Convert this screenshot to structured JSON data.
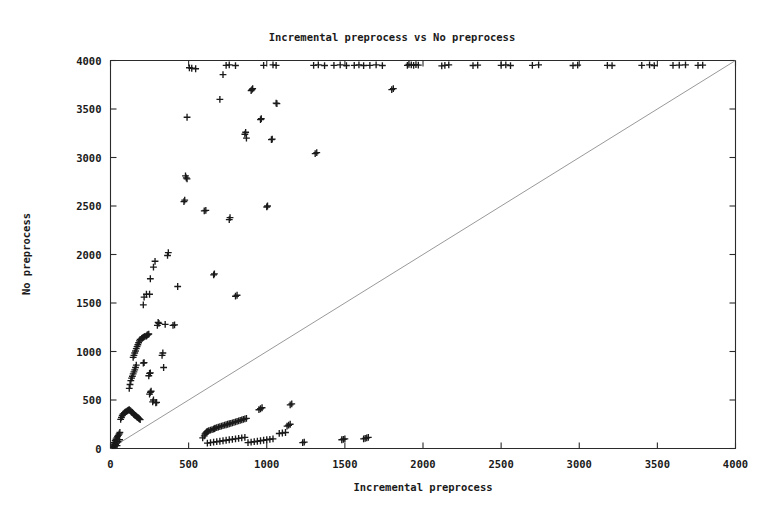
{
  "chart_data": {
    "type": "scatter",
    "title": "Incremental preprocess vs No preprocess",
    "xlabel": "Incremental preprocess",
    "ylabel": "No preprocess",
    "xlim": [
      0,
      4000
    ],
    "ylim": [
      0,
      4000
    ],
    "xticks": [
      0,
      500,
      1000,
      1500,
      2000,
      2500,
      3000,
      3500,
      4000
    ],
    "yticks": [
      0,
      500,
      1000,
      1500,
      2000,
      2500,
      3000,
      3500,
      4000
    ],
    "xtick_labels": [
      "0",
      "500",
      "1000",
      "1500",
      "2000",
      "2500",
      "3000",
      "3500",
      "4000"
    ],
    "ytick_labels": [
      "0",
      "500",
      "1000",
      "1500",
      "2000",
      "2500",
      "3000",
      "3500",
      "4000"
    ],
    "grid": false,
    "legend": "none",
    "marker": "plus",
    "marker_color": "#1a1a1a",
    "reference_line": {
      "label": "y = x diagonal",
      "from": [
        0,
        0
      ],
      "to": [
        4000,
        4000
      ],
      "color": "#8d8d8d"
    },
    "series": [
      {
        "name": "runs",
        "points": [
          [
            10,
            10
          ],
          [
            15,
            20
          ],
          [
            18,
            35
          ],
          [
            20,
            15
          ],
          [
            22,
            45
          ],
          [
            25,
            60
          ],
          [
            28,
            25
          ],
          [
            30,
            80
          ],
          [
            32,
            40
          ],
          [
            35,
            95
          ],
          [
            38,
            55
          ],
          [
            40,
            110
          ],
          [
            42,
            30
          ],
          [
            45,
            125
          ],
          [
            48,
            70
          ],
          [
            50,
            135
          ],
          [
            55,
            150
          ],
          [
            58,
            90
          ],
          [
            60,
            165
          ],
          [
            65,
            300
          ],
          [
            70,
            320
          ],
          [
            75,
            340
          ],
          [
            80,
            355
          ],
          [
            85,
            360
          ],
          [
            90,
            370
          ],
          [
            95,
            375
          ],
          [
            100,
            380
          ],
          [
            105,
            385
          ],
          [
            110,
            390
          ],
          [
            115,
            395
          ],
          [
            120,
            400
          ],
          [
            125,
            392
          ],
          [
            130,
            385
          ],
          [
            135,
            378
          ],
          [
            140,
            370
          ],
          [
            145,
            362
          ],
          [
            150,
            350
          ],
          [
            155,
            345
          ],
          [
            160,
            340
          ],
          [
            165,
            332
          ],
          [
            170,
            325
          ],
          [
            175,
            318
          ],
          [
            180,
            312
          ],
          [
            185,
            305
          ],
          [
            190,
            298
          ],
          [
            120,
            620
          ],
          [
            125,
            660
          ],
          [
            130,
            700
          ],
          [
            135,
            725
          ],
          [
            140,
            745
          ],
          [
            145,
            770
          ],
          [
            150,
            790
          ],
          [
            155,
            810
          ],
          [
            160,
            835
          ],
          [
            165,
            860
          ],
          [
            145,
            940
          ],
          [
            150,
            960
          ],
          [
            155,
            985
          ],
          [
            160,
            1005
          ],
          [
            165,
            1030
          ],
          [
            170,
            1050
          ],
          [
            175,
            1070
          ],
          [
            180,
            1090
          ],
          [
            185,
            1110
          ],
          [
            190,
            1125
          ],
          [
            200,
            1135
          ],
          [
            205,
            1140
          ],
          [
            210,
            1145
          ],
          [
            215,
            1150
          ],
          [
            220,
            1155
          ],
          [
            230,
            1160
          ],
          [
            235,
            1170
          ],
          [
            240,
            1175
          ],
          [
            245,
            1180
          ],
          [
            210,
            1480
          ],
          [
            215,
            1560
          ],
          [
            230,
            1590
          ],
          [
            250,
            1590
          ],
          [
            255,
            1750
          ],
          [
            275,
            1870
          ],
          [
            285,
            1930
          ],
          [
            300,
            1270
          ],
          [
            305,
            1300
          ],
          [
            310,
            1290
          ],
          [
            330,
            960
          ],
          [
            335,
            985
          ],
          [
            340,
            835
          ],
          [
            245,
            750
          ],
          [
            250,
            775
          ],
          [
            255,
            780
          ],
          [
            210,
            880
          ],
          [
            215,
            885
          ],
          [
            250,
            560
          ],
          [
            255,
            580
          ],
          [
            260,
            590
          ],
          [
            270,
            480
          ],
          [
            275,
            500
          ],
          [
            290,
            470
          ],
          [
            295,
            475
          ],
          [
            350,
            1280
          ],
          [
            365,
            1990
          ],
          [
            370,
            2020
          ],
          [
            400,
            1270
          ],
          [
            410,
            1275
          ],
          [
            430,
            1670
          ],
          [
            470,
            2545
          ],
          [
            475,
            2560
          ],
          [
            480,
            2810
          ],
          [
            485,
            2790
          ],
          [
            490,
            2780
          ],
          [
            490,
            3415
          ],
          [
            505,
            3925
          ],
          [
            520,
            3920
          ],
          [
            545,
            3915
          ],
          [
            600,
            2450
          ],
          [
            610,
            2455
          ],
          [
            660,
            1790
          ],
          [
            665,
            1800
          ],
          [
            700,
            3600
          ],
          [
            720,
            3855
          ],
          [
            760,
            2360
          ],
          [
            765,
            2380
          ],
          [
            800,
            1570
          ],
          [
            810,
            1580
          ],
          [
            860,
            3240
          ],
          [
            865,
            3260
          ],
          [
            870,
            3200
          ],
          [
            900,
            3690
          ],
          [
            905,
            3700
          ],
          [
            910,
            3710
          ],
          [
            960,
            3390
          ],
          [
            965,
            3400
          ],
          [
            1000,
            2490
          ],
          [
            1005,
            2500
          ],
          [
            1030,
            3185
          ],
          [
            1035,
            3190
          ],
          [
            1060,
            3560
          ],
          [
            1065,
            3555
          ],
          [
            1310,
            3040
          ],
          [
            1320,
            3050
          ],
          [
            1800,
            3700
          ],
          [
            1810,
            3710
          ],
          [
            590,
            110
          ],
          [
            600,
            130
          ],
          [
            605,
            150
          ],
          [
            610,
            160
          ],
          [
            615,
            170
          ],
          [
            620,
            175
          ],
          [
            625,
            180
          ],
          [
            630,
            185
          ],
          [
            640,
            190
          ],
          [
            650,
            195
          ],
          [
            660,
            200
          ],
          [
            665,
            205
          ],
          [
            670,
            210
          ],
          [
            680,
            215
          ],
          [
            690,
            220
          ],
          [
            700,
            225
          ],
          [
            710,
            230
          ],
          [
            720,
            235
          ],
          [
            730,
            240
          ],
          [
            740,
            245
          ],
          [
            750,
            250
          ],
          [
            760,
            255
          ],
          [
            770,
            260
          ],
          [
            780,
            265
          ],
          [
            790,
            270
          ],
          [
            800,
            275
          ],
          [
            810,
            280
          ],
          [
            820,
            285
          ],
          [
            830,
            290
          ],
          [
            840,
            295
          ],
          [
            850,
            300
          ],
          [
            860,
            305
          ],
          [
            870,
            310
          ],
          [
            620,
            55
          ],
          [
            640,
            60
          ],
          [
            660,
            65
          ],
          [
            680,
            70
          ],
          [
            700,
            75
          ],
          [
            720,
            80
          ],
          [
            740,
            85
          ],
          [
            760,
            90
          ],
          [
            780,
            95
          ],
          [
            800,
            100
          ],
          [
            820,
            105
          ],
          [
            840,
            110
          ],
          [
            860,
            115
          ],
          [
            880,
            60
          ],
          [
            900,
            65
          ],
          [
            920,
            70
          ],
          [
            940,
            75
          ],
          [
            960,
            80
          ],
          [
            980,
            85
          ],
          [
            1000,
            90
          ],
          [
            1020,
            95
          ],
          [
            1040,
            100
          ],
          [
            1080,
            155
          ],
          [
            1100,
            160
          ],
          [
            1120,
            165
          ],
          [
            950,
            400
          ],
          [
            960,
            410
          ],
          [
            970,
            420
          ],
          [
            1150,
            450
          ],
          [
            1160,
            460
          ],
          [
            1130,
            230
          ],
          [
            1140,
            240
          ],
          [
            1150,
            250
          ],
          [
            1230,
            60
          ],
          [
            1240,
            65
          ],
          [
            1480,
            90
          ],
          [
            1490,
            95
          ],
          [
            1500,
            100
          ],
          [
            1620,
            100
          ],
          [
            1630,
            105
          ],
          [
            1640,
            110
          ],
          [
            1650,
            115
          ],
          [
            1900,
            3950
          ],
          [
            1910,
            3960
          ],
          [
            1925,
            3955
          ],
          [
            1940,
            3950
          ],
          [
            1955,
            3958
          ],
          [
            1970,
            3952
          ],
          [
            2120,
            3945
          ],
          [
            2140,
            3950
          ],
          [
            2165,
            3955
          ],
          [
            2320,
            3948
          ],
          [
            2350,
            3952
          ],
          [
            2500,
            3950
          ],
          [
            2530,
            3955
          ],
          [
            2560,
            3948
          ],
          [
            2700,
            3950
          ],
          [
            2740,
            3955
          ],
          [
            2960,
            3948
          ],
          [
            2990,
            3952
          ],
          [
            3180,
            3950
          ],
          [
            3210,
            3948
          ],
          [
            3400,
            3950
          ],
          [
            3450,
            3955
          ],
          [
            3480,
            3948
          ],
          [
            3600,
            3950
          ],
          [
            3640,
            3952
          ],
          [
            3680,
            3955
          ],
          [
            3760,
            3950
          ],
          [
            3790,
            3952
          ],
          [
            980,
            3950
          ],
          [
            1040,
            3955
          ],
          [
            1060,
            3950
          ],
          [
            1300,
            3950
          ],
          [
            1330,
            3955
          ],
          [
            1370,
            3948
          ],
          [
            1430,
            3950
          ],
          [
            1470,
            3955
          ],
          [
            1510,
            3948
          ],
          [
            1560,
            3950
          ],
          [
            1590,
            3955
          ],
          [
            1620,
            3948
          ],
          [
            1660,
            3950
          ],
          [
            1700,
            3955
          ],
          [
            1740,
            3948
          ],
          [
            740,
            3950
          ],
          [
            760,
            3955
          ],
          [
            800,
            3948
          ]
        ]
      }
    ]
  }
}
